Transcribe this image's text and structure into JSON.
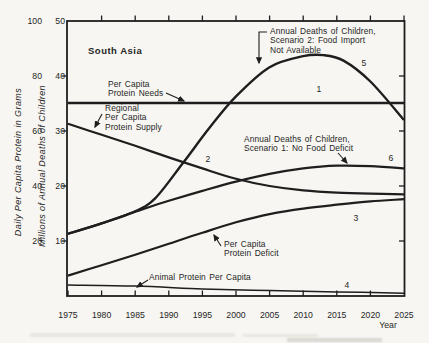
{
  "figure": {
    "kind": "scanned line chart",
    "paper_color": "#f7f6f2",
    "ink_color": "#1e1e1e"
  },
  "chart_data": {
    "type": "line",
    "title": "South Asia",
    "x_axis": {
      "label": "Year",
      "range": [
        1975,
        2025
      ],
      "ticks": [
        1975,
        1980,
        1985,
        1990,
        1995,
        2000,
        2005,
        2010,
        2015,
        2020,
        2025
      ]
    },
    "y_axis_outer": {
      "label": "Daily Per Capita Protein in Grams",
      "range": [
        0,
        100
      ],
      "ticks": [
        20,
        40,
        60,
        80,
        100
      ]
    },
    "y_axis_inner": {
      "label": "Millions of Annual Deaths of Children",
      "range": [
        0,
        50
      ],
      "ticks": [
        10,
        20,
        30,
        40,
        50
      ]
    },
    "units_note": "values stored on inner scale (millions of deaths); protein curves read on grams scale = 2x inner scale",
    "grid": false,
    "series": [
      {
        "number": 1,
        "name": "Per Capita Protein Needs",
        "stroke_width": 2.4,
        "points": [
          [
            1975,
            35.1
          ],
          [
            2025,
            35.1
          ]
        ]
      },
      {
        "number": 2,
        "name": "Regional Per Capita Protein Supply",
        "stroke_width": 2.2,
        "points": [
          [
            1975,
            31.3
          ],
          [
            1980,
            29.3
          ],
          [
            1985,
            27.3
          ],
          [
            1990,
            25.2
          ],
          [
            1995,
            23.2
          ],
          [
            2000,
            21.3
          ],
          [
            2005,
            20.0
          ],
          [
            2010,
            19.2
          ],
          [
            2015,
            18.8
          ],
          [
            2020,
            18.6
          ],
          [
            2025,
            18.5
          ]
        ]
      },
      {
        "number": 3,
        "name": "Per Capita Protein Deficit",
        "stroke_width": 2.2,
        "points": [
          [
            1975,
            3.7
          ],
          [
            1980,
            5.6
          ],
          [
            1985,
            7.5
          ],
          [
            1990,
            9.5
          ],
          [
            1995,
            11.5
          ],
          [
            2000,
            13.4
          ],
          [
            2005,
            14.9
          ],
          [
            2010,
            15.9
          ],
          [
            2015,
            16.6
          ],
          [
            2020,
            17.2
          ],
          [
            2025,
            17.6
          ]
        ]
      },
      {
        "number": 4,
        "name": "Animal Protein Per Capita",
        "stroke_width": 1.5,
        "points": [
          [
            1975,
            2.0
          ],
          [
            1985,
            1.8
          ],
          [
            1995,
            1.3
          ],
          [
            2005,
            1.0
          ],
          [
            2015,
            0.75
          ],
          [
            2025,
            0.5
          ]
        ]
      },
      {
        "number": 5,
        "name": "Annual Deaths of Children, Scenario 2: Food Import Not Available",
        "stroke_width": 2.4,
        "points": [
          [
            1975,
            11.3
          ],
          [
            1980,
            13.2
          ],
          [
            1985,
            15.4
          ],
          [
            1988,
            17.8
          ],
          [
            1992,
            24.0
          ],
          [
            1996,
            30.5
          ],
          [
            2000,
            36.3
          ],
          [
            2005,
            41.6
          ],
          [
            2010,
            43.6
          ],
          [
            2013,
            43.8
          ],
          [
            2016,
            42.8
          ],
          [
            2020,
            39.0
          ],
          [
            2025,
            32.0
          ]
        ]
      },
      {
        "number": 6,
        "name": "Annual Deaths of Children, Scenario 1: No Food Deficit",
        "stroke_width": 2.2,
        "points": [
          [
            1975,
            11.3
          ],
          [
            1980,
            13.2
          ],
          [
            1985,
            15.3
          ],
          [
            1990,
            17.3
          ],
          [
            1995,
            19.1
          ],
          [
            2000,
            20.8
          ],
          [
            2005,
            22.2
          ],
          [
            2010,
            23.2
          ],
          [
            2015,
            23.7
          ],
          [
            2020,
            23.6
          ],
          [
            2025,
            23.2
          ]
        ]
      }
    ],
    "curve_number_labels": [
      {
        "text": "1",
        "x": 319,
        "y": 92
      },
      {
        "text": "2",
        "x": 208,
        "y": 162
      },
      {
        "text": "3",
        "x": 356,
        "y": 221
      },
      {
        "text": "4",
        "x": 347,
        "y": 288
      },
      {
        "text": "5",
        "x": 364,
        "y": 66
      },
      {
        "text": "6",
        "x": 391,
        "y": 161
      }
    ],
    "annotations": [
      {
        "id": "region-title",
        "lines": [
          "South Asia"
        ],
        "x": 88,
        "y": 47,
        "bold": true
      },
      {
        "id": "needs-label",
        "lines": [
          "Per Capita",
          "Protein Needs"
        ],
        "x": 108,
        "y": 80
      },
      {
        "id": "supply-label",
        "lines": [
          "Regional",
          "Per Capita",
          "Protein Supply"
        ],
        "x": 105,
        "y": 104
      },
      {
        "id": "scenario2-label",
        "lines": [
          "Annual Deaths of Children,",
          "Scenario 2: Food Import",
          "Not Available"
        ],
        "x": 270,
        "y": 27
      },
      {
        "id": "scenario1-label",
        "lines": [
          "Annual Deaths of Children,",
          "Scenario 1: No Food Deficit"
        ],
        "x": 244,
        "y": 135
      },
      {
        "id": "deficit-label",
        "lines": [
          "Per Capita",
          "Protein Deficit"
        ],
        "x": 224,
        "y": 240
      },
      {
        "id": "animal-label",
        "lines": [
          "Animal Protein Per Capita"
        ],
        "x": 149,
        "y": 273
      }
    ],
    "arrows": [
      {
        "id": "needs-arrow",
        "points": [
          [
            166,
            93
          ],
          [
            184,
            101
          ]
        ]
      },
      {
        "id": "supply-arrow",
        "points": [
          [
            102,
            114
          ],
          [
            95,
            127
          ]
        ]
      },
      {
        "id": "scenario2-arrow",
        "points": [
          [
            267,
            32
          ],
          [
            259,
            32
          ],
          [
            259,
            63
          ]
        ]
      },
      {
        "id": "scenario1-arrow",
        "points": [
          [
            338,
            153
          ],
          [
            347,
            163
          ]
        ]
      },
      {
        "id": "deficit-arrow",
        "points": [
          [
            221,
            246
          ],
          [
            214,
            235
          ]
        ]
      },
      {
        "id": "animal-arrow",
        "points": [
          [
            148,
            280
          ],
          [
            137,
            287
          ]
        ]
      }
    ],
    "layout": {
      "plot": {
        "left": 67,
        "top": 21,
        "right": 404.5,
        "bottom": 296
      },
      "x0_year": 1975,
      "px_per_year": 6.72,
      "v0_y": 296,
      "px_per_unit": 5.5,
      "tick_len": 5.5,
      "x_label_baseline": 318,
      "year_label_pos": {
        "x": 388,
        "y": 328
      },
      "gram_label_right_x": 42,
      "death_label_right_x": 65,
      "outer_title_center": [
        21,
        162
      ],
      "inner_title_center": [
        45,
        166
      ],
      "annotation_line_height": 9.3,
      "smudges": [
        {
          "x": 30,
          "y": 333,
          "w": 205,
          "h": 4,
          "o": 0.15
        },
        {
          "x": 243,
          "y": 334,
          "w": 75,
          "h": 3,
          "o": 0.15
        },
        {
          "x": 287,
          "y": 338,
          "w": 95,
          "h": 4,
          "o": 0.28
        }
      ]
    }
  }
}
